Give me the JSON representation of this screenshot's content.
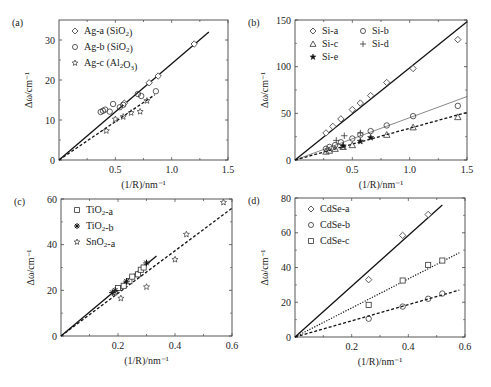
{
  "chart_data": [
    {
      "panel": "(a)",
      "type": "scatter",
      "xlabel": "(1/R)/nm⁻¹",
      "ylabel": "Δω/cm⁻¹",
      "xlim": [
        0,
        1.5
      ],
      "ylim": [
        0,
        35
      ],
      "xticks": [
        0.5,
        1.0,
        1.5
      ],
      "xtick_labels": [
        "0.5",
        "1.0",
        "1.5"
      ],
      "yticks": [
        0,
        10,
        20,
        30
      ],
      "ytick_labels": [
        "0",
        "10",
        "20",
        "30"
      ],
      "legend_position": "upper left",
      "grid": false,
      "series": [
        {
          "name": "Ag-a (SiO2)",
          "legend": "Ag-a (SiO₂)",
          "marker": "diamond",
          "x": [
            0.58,
            0.8,
            0.88,
            1.2
          ],
          "y": [
            14.2,
            19.3,
            21.0,
            29.0
          ],
          "fit": {
            "style": "solid",
            "x": [
              0,
              1.33
            ],
            "y": [
              0,
              32
            ]
          }
        },
        {
          "name": "Ag-b (SiO2)",
          "legend": "Ag-b (SiO₂)",
          "marker": "circle",
          "x": [
            0.37,
            0.39,
            0.41,
            0.45,
            0.48,
            0.54,
            0.57,
            0.7,
            0.73,
            0.86
          ],
          "y": [
            12.0,
            12.3,
            12.6,
            12.1,
            14.0,
            13.2,
            13.8,
            16.5,
            16.0,
            17.2
          ],
          "fit": null
        },
        {
          "name": "Ag-c (Al2O3)",
          "legend": "Ag-c (Al₂O₃)",
          "marker": "star",
          "x": [
            0.42,
            0.5,
            0.57,
            0.64,
            0.72,
            0.78
          ],
          "y": [
            7.3,
            10.2,
            10.8,
            11.8,
            12.1,
            14.8
          ],
          "fit": {
            "style": "dashed",
            "x": [
              0,
              0.85
            ],
            "y": [
              0,
              16.3
            ]
          }
        }
      ]
    },
    {
      "panel": "(b)",
      "type": "scatter",
      "xlabel": "(1/R)/nm⁻¹",
      "ylabel": "Δω/cm⁻¹",
      "xlim": [
        0,
        1.5
      ],
      "ylim": [
        0,
        150
      ],
      "xticks": [
        0.5,
        1.0,
        1.5
      ],
      "xtick_labels": [
        "0.5",
        "1.0",
        "1.5"
      ],
      "yticks": [
        0,
        50,
        100,
        150
      ],
      "ytick_labels": [
        "0",
        "50",
        "100",
        "150"
      ],
      "legend_position": "upper left",
      "grid": false,
      "series": [
        {
          "name": "Si-a",
          "legend": "Si-a",
          "marker": "diamond",
          "x": [
            0.27,
            0.33,
            0.4,
            0.5,
            0.57,
            0.66,
            0.8,
            1.03,
            1.42
          ],
          "y": [
            29,
            36,
            44,
            54,
            61,
            69,
            83,
            98,
            129
          ],
          "fit": {
            "style": "solid",
            "x": [
              0,
              1.5
            ],
            "y": [
              0,
              148
            ]
          }
        },
        {
          "name": "Si-b",
          "legend": "Si-b",
          "marker": "circle",
          "x": [
            0.27,
            0.3,
            0.35,
            0.4,
            0.5,
            0.57,
            0.66,
            0.8,
            1.03,
            1.42
          ],
          "y": [
            12,
            14,
            16,
            19,
            23,
            27,
            31,
            37,
            47,
            58
          ],
          "fit": {
            "style": "solid-thin",
            "x": [
              0,
              1.5
            ],
            "y": [
              0,
              68
            ]
          }
        },
        {
          "name": "Si-c",
          "legend": "Si-c",
          "marker": "triangle",
          "x": [
            0.27,
            0.3,
            0.35,
            0.42,
            0.5,
            0.8,
            1.03,
            1.42
          ],
          "y": [
            9,
            10,
            12,
            14,
            16,
            27,
            35,
            46
          ],
          "fit": {
            "style": "dashed",
            "x": [
              0,
              1.5
            ],
            "y": [
              0,
              51
            ]
          }
        },
        {
          "name": "Si-d",
          "legend": "Si-d",
          "marker": "plus",
          "x": [
            0.36,
            0.43,
            0.57
          ],
          "y": [
            21,
            26,
            29
          ],
          "fit": null
        },
        {
          "name": "Si-e",
          "legend": "Si-e",
          "marker": "filled-star",
          "x": [
            0.42,
            0.57,
            0.66
          ],
          "y": [
            15,
            20,
            24
          ],
          "fit": null
        }
      ]
    },
    {
      "panel": "(c)",
      "type": "scatter",
      "xlabel": "(1/R)/nm⁻¹",
      "ylabel": "Δω/cm⁻¹",
      "xlim": [
        0,
        0.6
      ],
      "ylim": [
        0,
        60
      ],
      "xticks": [
        0.2,
        0.4,
        0.6
      ],
      "xtick_labels": [
        "0.2",
        "0.4",
        "0.6"
      ],
      "yticks": [
        0,
        20,
        40,
        60
      ],
      "ytick_labels": [
        "0",
        "20",
        "40",
        "60"
      ],
      "legend_position": "upper left",
      "grid": false,
      "series": [
        {
          "name": "TiO2-a",
          "legend": "TiO₂-a",
          "marker": "square",
          "x": [
            0.2,
            0.22,
            0.24,
            0.25,
            0.27,
            0.28,
            0.29
          ],
          "y": [
            21,
            22,
            24,
            26,
            27,
            29,
            30
          ],
          "fit": {
            "style": "solid",
            "x": [
              0,
              0.335
            ],
            "y": [
              0,
              35
            ]
          }
        },
        {
          "name": "TiO2-b",
          "legend": "TiO₂-b",
          "marker": "asterisk",
          "x": [
            0.18,
            0.19,
            0.23,
            0.3
          ],
          "y": [
            19,
            20,
            24,
            32
          ],
          "fit": null
        },
        {
          "name": "SnO2-a",
          "legend": "SnO₂-a",
          "marker": "star",
          "x": [
            0.19,
            0.21,
            0.3,
            0.4,
            0.44,
            0.57
          ],
          "y": [
            19,
            16.5,
            21.5,
            33.5,
            44.5,
            58.5
          ],
          "fit": {
            "style": "dashed",
            "x": [
              0,
              0.6
            ],
            "y": [
              0,
              56
            ]
          }
        }
      ]
    },
    {
      "panel": "(d)",
      "type": "scatter",
      "xlabel": "(1/R)/nm⁻¹",
      "ylabel": "Δω/cm⁻¹",
      "xlim": [
        0,
        0.6
      ],
      "ylim": [
        0,
        80
      ],
      "xticks": [
        0.2,
        0.4,
        0.6
      ],
      "xtick_labels": [
        "0.2",
        "0.4",
        "0.6"
      ],
      "yticks": [
        0,
        20,
        40,
        60,
        80
      ],
      "ytick_labels": [
        "0",
        "20",
        "40",
        "60",
        "80"
      ],
      "legend_position": "upper left",
      "grid": false,
      "series": [
        {
          "name": "CdSe-a",
          "legend": "CdSe-a",
          "marker": "diamond",
          "x": [
            0.26,
            0.38,
            0.47
          ],
          "y": [
            33,
            58.5,
            70.5
          ],
          "fit": {
            "style": "solid",
            "x": [
              0,
              0.52
            ],
            "y": [
              0,
              76
            ]
          }
        },
        {
          "name": "CdSe-b",
          "legend": "CdSe-b",
          "marker": "circle",
          "x": [
            0.26,
            0.38,
            0.47,
            0.52
          ],
          "y": [
            10.5,
            17.5,
            22,
            25
          ],
          "fit": {
            "style": "dashed",
            "x": [
              0,
              0.58
            ],
            "y": [
              0,
              27
            ]
          }
        },
        {
          "name": "CdSe-c",
          "legend": "CdSe-c",
          "marker": "square",
          "x": [
            0.26,
            0.38,
            0.47,
            0.52
          ],
          "y": [
            18.5,
            32.5,
            41.5,
            44
          ],
          "fit": {
            "style": "dotted",
            "x": [
              0,
              0.58
            ],
            "y": [
              0,
              48.5
            ]
          }
        }
      ]
    }
  ],
  "layout": {
    "panels": [
      {
        "left": 59,
        "right": 228,
        "top": 20,
        "bottom": 160
      },
      {
        "left": 295,
        "right": 467,
        "top": 20,
        "bottom": 160
      },
      {
        "left": 61,
        "right": 232,
        "top": 199,
        "bottom": 336
      },
      {
        "left": 295,
        "right": 465,
        "top": 198,
        "bottom": 337
      }
    ]
  }
}
